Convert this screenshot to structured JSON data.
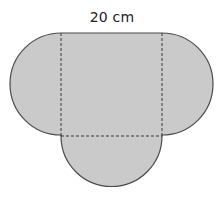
{
  "diagram": {
    "dimension_label": "20 cm",
    "shapes": {
      "square": {
        "x": 61,
        "y": 32,
        "width": 101,
        "height": 104
      },
      "semicircles": [
        {
          "position": "left",
          "cx": 61,
          "cy": 84,
          "r": 51
        },
        {
          "position": "right",
          "cx": 162,
          "cy": 84,
          "r": 51
        },
        {
          "position": "bottom",
          "cx": 111.5,
          "cy": 136,
          "r": 50.5
        }
      ]
    },
    "colors": {
      "fill": "#cacaca",
      "outline": "#4a4a4a",
      "dashed": "#3a3a3a"
    }
  }
}
